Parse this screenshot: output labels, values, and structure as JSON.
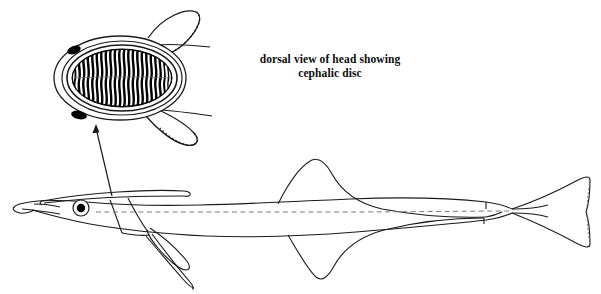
{
  "figure": {
    "background_color": "#ffffff",
    "ink_color": "#1a1a1a",
    "fill_black": "#000000",
    "width": 601,
    "height": 294
  },
  "caption": {
    "line1": "dorsal view of head showing",
    "line2": "cephalic disc"
  },
  "inset": {
    "name": "cephalic disc dorsal view",
    "center_x": 120,
    "center_y": 78,
    "disc_rx": 66,
    "disc_ry": 42,
    "lamellae_count": 23,
    "lamellae_color": "#000000",
    "outline_color": "#1a1a1a",
    "pectoral_fins": 2,
    "fin_edge_style": "dotted distal margin"
  },
  "leader": {
    "name": "pointer from fish head to inset",
    "from_x": 112,
    "from_y": 195,
    "to_x": 96,
    "to_y": 126,
    "arrowhead": "at inset end"
  },
  "fish": {
    "name": "remora lateral view",
    "snout_x": 28,
    "tail_tip_x": 590,
    "body_midline_y": 212,
    "lateral_line_style": "dashed",
    "parts": [
      {
        "label": "snout",
        "interactable": false
      },
      {
        "label": "eye",
        "interactable": false
      },
      {
        "label": "cephalic disc",
        "interactable": false
      },
      {
        "label": "pectoral fin",
        "interactable": false
      },
      {
        "label": "pelvic fin",
        "interactable": false
      },
      {
        "label": "dorsal fin",
        "interactable": false
      },
      {
        "label": "anal fin",
        "interactable": false
      },
      {
        "label": "caudal fin",
        "interactable": false
      },
      {
        "label": "lateral line",
        "interactable": false
      }
    ]
  }
}
